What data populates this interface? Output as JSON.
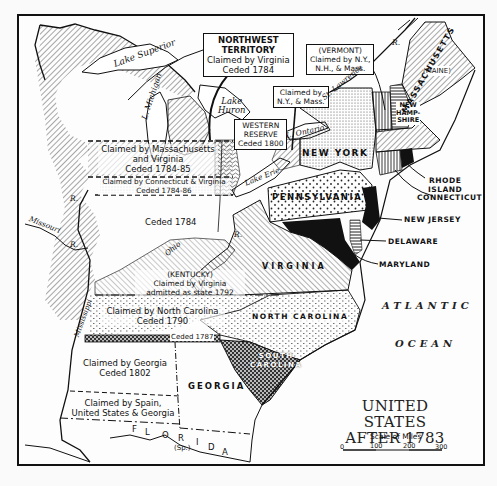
{
  "map": {
    "title_line1": "UNITED STATES",
    "title_line2": "AFTER 1783",
    "scale": {
      "label": "Scale of Miles",
      "ticks": [
        "0",
        "100",
        "200",
        "300"
      ]
    },
    "ocean_labels": [
      "ATLANTIC",
      "OCEAN"
    ],
    "boxed_labels": {
      "northwest_territory": [
        "NORTHWEST",
        "TERRITORY",
        "Claimed by Virginia",
        "Ceded 1784"
      ],
      "vermont": [
        "(VERMONT)",
        "Claimed by N.Y.,",
        "N.H., & Mass."
      ],
      "ny_mass": [
        "Claimed by",
        "N.Y., & Mass."
      ],
      "western_reserve": [
        "WESTERN",
        "RESERVE",
        "Ceded 1800"
      ]
    },
    "regions": {
      "mass_virginia": [
        "Claimed by Massachusetts",
        "and Virginia",
        "Ceded 1784-85"
      ],
      "conn_virginia": [
        "Claimed by Connecticut & Virginia",
        "Ceded 1784-86"
      ],
      "ceded_1784": "Ceded 1784",
      "kentucky": [
        "(KENTUCKY)",
        "Claimed by Virginia",
        "admitted as state 1792"
      ],
      "north_carolina_claim": [
        "Claimed by North Carolina",
        "Ceded 1790"
      ],
      "ceded_1787": "Ceded 1787",
      "georgia_claim": [
        "Claimed by Georgia",
        "Ceded 1802"
      ],
      "spain_claim": [
        "Claimed by Spain,",
        "United States & Georgia"
      ],
      "florida": [
        "F",
        "L",
        "O",
        "R",
        "I",
        "D",
        "A"
      ],
      "florida_note": "(Sp.)"
    },
    "states": {
      "maine": "(MAINE)",
      "new_hampshire": [
        "NEW",
        "HAMP-",
        "SHIRE"
      ],
      "massachusetts": "MASSACHUSETTS",
      "new_york": "NEW YORK",
      "pennsylvania": "PENNSYLVANIA",
      "virginia": "VIRGINIA",
      "north_carolina": "NORTH CAROLINA",
      "south_carolina": [
        "SOUTH",
        "CAROLINA"
      ],
      "georgia": "GEORGIA"
    },
    "callouts": {
      "rhode_island": [
        "RHODE",
        "ISLAND"
      ],
      "connecticut": "CONNECTICUT",
      "new_jersey": "NEW JERSEY",
      "delaware": "DELAWARE",
      "maryland": "MARYLAND"
    },
    "water": {
      "lake_superior": "Lake Superior",
      "lake_michigan": "L. Michigan",
      "lake_huron": [
        "Lake",
        "Huron"
      ],
      "lake_erie": "Lake Erie",
      "lake_ontario": "L. Ontario",
      "st_lawrence": "St. Lawrence",
      "st_lawrence_r": "R.",
      "missouri": "Missouri",
      "missouri_r": "R.",
      "mississippi": "Mississippi",
      "mississippi_r": "R.",
      "ohio": "Ohio",
      "ohio_r": "R."
    }
  }
}
